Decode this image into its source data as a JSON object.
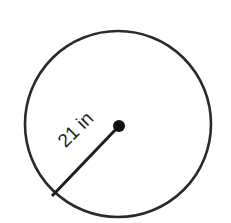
{
  "diagram": {
    "type": "circle-radius",
    "shape": "circle",
    "radius_label": "21 in",
    "radius_value": 21,
    "unit": "in",
    "colors": {
      "stroke": "#2a2a2a",
      "center_dot": "#111111",
      "background": "#ffffff"
    }
  }
}
